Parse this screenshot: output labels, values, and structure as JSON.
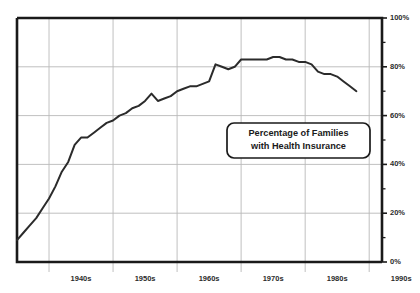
{
  "chart_data": {
    "type": "line",
    "title": "",
    "xlabel": "",
    "ylabel": "",
    "ylim": [
      0,
      100
    ],
    "xlim": [
      1935,
      1992
    ],
    "grid": true,
    "legend_position": "inside-right",
    "annotations": [
      {
        "name": "series-label-box",
        "line1": "Percentage of Families",
        "line2": "with Health Insurance"
      }
    ],
    "y_ticks": [
      {
        "value": 0,
        "label": "0%"
      },
      {
        "value": 10,
        "label": ""
      },
      {
        "value": 20,
        "label": "20%"
      },
      {
        "value": 30,
        "label": ""
      },
      {
        "value": 40,
        "label": "40%"
      },
      {
        "value": 50,
        "label": ""
      },
      {
        "value": 60,
        "label": "60%"
      },
      {
        "value": 70,
        "label": ""
      },
      {
        "value": 80,
        "label": "80%"
      },
      {
        "value": 90,
        "label": ""
      },
      {
        "value": 100,
        "label": "100%"
      }
    ],
    "x_ticks": [
      {
        "value": 1940,
        "label": "1940s"
      },
      {
        "value": 1950,
        "label": "1950s"
      },
      {
        "value": 1960,
        "label": "1960s"
      },
      {
        "value": 1970,
        "label": "1970s"
      },
      {
        "value": 1980,
        "label": "1980s"
      },
      {
        "value": 1990,
        "label": "1990s"
      }
    ],
    "x_gridlines": [
      1940,
      1950,
      1960,
      1970,
      1980,
      1990
    ],
    "series": [
      {
        "name": "Percentage of Families with Health Insurance",
        "color": "#2b2b2b",
        "x": [
          1935,
          1936,
          1937,
          1938,
          1939,
          1940,
          1941,
          1942,
          1943,
          1944,
          1945,
          1946,
          1947,
          1948,
          1949,
          1950,
          1951,
          1952,
          1953,
          1954,
          1955,
          1956,
          1957,
          1958,
          1959,
          1960,
          1961,
          1962,
          1963,
          1964,
          1965,
          1966,
          1967,
          1968,
          1969,
          1970,
          1971,
          1972,
          1973,
          1974,
          1975,
          1976,
          1977,
          1978,
          1979,
          1980,
          1981,
          1982,
          1983,
          1984,
          1985,
          1986,
          1987,
          1988
        ],
        "values": [
          9,
          12,
          15,
          18,
          22,
          26,
          31,
          37,
          41,
          48,
          51,
          51,
          53,
          55,
          57,
          58,
          60,
          61,
          63,
          64,
          66,
          69,
          66,
          67,
          68,
          70,
          71,
          72,
          72,
          73,
          74,
          81,
          80,
          79,
          80,
          83,
          83,
          83,
          83,
          83,
          84,
          84,
          83,
          83,
          82,
          82,
          81,
          78,
          77,
          77,
          76,
          74,
          72,
          70
        ]
      }
    ]
  },
  "axis": {
    "y_axis_name": "percentage-axis",
    "x_axis_name": "decade-axis"
  }
}
